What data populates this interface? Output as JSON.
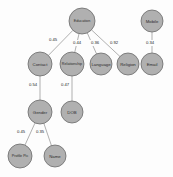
{
  "diagram": {
    "background_color": "#fdfdfd",
    "node_fill_color": "#b0b0b0",
    "node_stroke_color": "#6a6a6a",
    "edge_color": "#8e8e8e",
    "label_color": "#2b2b2b"
  },
  "nodes": [
    {
      "id": "education",
      "label": "Education",
      "x": 82,
      "y": 21,
      "r": 13
    },
    {
      "id": "contact",
      "label": "Contact",
      "x": 40,
      "y": 64,
      "r": 12
    },
    {
      "id": "relationship",
      "label": "Relationship",
      "x": 72,
      "y": 64,
      "r": 12
    },
    {
      "id": "language",
      "label": "Language",
      "x": 101,
      "y": 64,
      "r": 11
    },
    {
      "id": "religion",
      "label": "Religion",
      "x": 128,
      "y": 64,
      "r": 11
    },
    {
      "id": "gender",
      "label": "Gender",
      "x": 40,
      "y": 112,
      "r": 12
    },
    {
      "id": "dob",
      "label": "DOB",
      "x": 72,
      "y": 112,
      "r": 11
    },
    {
      "id": "profilepic",
      "label": "Profile Pic",
      "x": 20,
      "y": 156,
      "r": 12
    },
    {
      "id": "name",
      "label": "Name",
      "x": 55,
      "y": 156,
      "r": 11
    },
    {
      "id": "mobile",
      "label": "Mobile",
      "x": 152,
      "y": 21,
      "r": 11
    },
    {
      "id": "email",
      "label": "Email",
      "x": 152,
      "y": 64,
      "r": 11
    }
  ],
  "edges": [
    {
      "id": "e1",
      "source": "education",
      "target": "contact",
      "weight": "0.45",
      "lx": 53,
      "ly": 40
    },
    {
      "id": "e2",
      "source": "education",
      "target": "relationship",
      "weight": "0.44",
      "lx": 77,
      "ly": 43
    },
    {
      "id": "e3",
      "source": "education",
      "target": "language",
      "weight": "0.36",
      "lx": 95,
      "ly": 43
    },
    {
      "id": "e4",
      "source": "education",
      "target": "religion",
      "weight": "0.92",
      "lx": 114,
      "ly": 43
    },
    {
      "id": "e5",
      "source": "contact",
      "target": "gender",
      "weight": "0.54",
      "lx": 33,
      "ly": 85
    },
    {
      "id": "e6",
      "source": "relationship",
      "target": "dob",
      "weight": "0.47",
      "lx": 65,
      "ly": 85
    },
    {
      "id": "e7",
      "source": "gender",
      "target": "profilepic",
      "weight": "0.45",
      "lx": 21,
      "ly": 132
    },
    {
      "id": "e8",
      "source": "gender",
      "target": "name",
      "weight": "0.35",
      "lx": 40,
      "ly": 132
    },
    {
      "id": "e9",
      "source": "mobile",
      "target": "email",
      "weight": "0.34",
      "lx": 150,
      "ly": 43
    }
  ]
}
